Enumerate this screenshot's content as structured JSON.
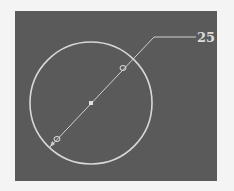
{
  "canvas": {
    "background": "#5a5a5a",
    "page_background": "#f4f4f4"
  },
  "circle": {
    "cx": 91,
    "cy": 103,
    "r": 61,
    "stroke": "#d8d8d8"
  },
  "dimension": {
    "type": "diameter",
    "value": "25",
    "line_start": [
      50,
      147
    ],
    "line_end": [
      154,
      37
    ],
    "leader_end": [
      196,
      37
    ],
    "center_point": [
      91,
      103
    ],
    "grip_points": [
      [
        123,
        68
      ],
      [
        57,
        139
      ]
    ],
    "stroke": "#d0d0d0"
  }
}
